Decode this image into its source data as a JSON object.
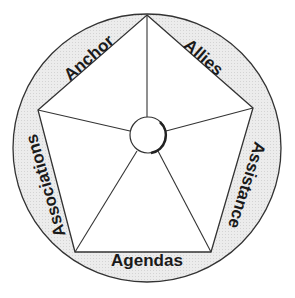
{
  "diagram": {
    "type": "pentagon-in-circle",
    "center_hub": "",
    "segments": [
      {
        "id": "anchor",
        "label": "Anchor",
        "position": "top-left"
      },
      {
        "id": "allies",
        "label": "Allies",
        "position": "top-right"
      },
      {
        "id": "assistance",
        "label": "Assistance",
        "position": "right"
      },
      {
        "id": "agendas",
        "label": "Agendas",
        "position": "bottom"
      },
      {
        "id": "associations",
        "label": "Associations",
        "position": "left"
      }
    ],
    "colors": {
      "ring_fill": "#e6e6e6",
      "stroke": "#333333",
      "inner_fill": "#ffffff"
    }
  }
}
